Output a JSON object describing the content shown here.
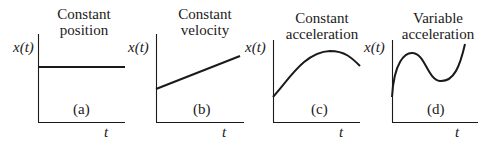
{
  "figure": {
    "ylabel": "x(t)",
    "xlabel": "t",
    "panels": [
      {
        "id": "a",
        "label": "(a)",
        "title_line1": "Constant",
        "title_line2": "position",
        "curve": "horizontal line"
      },
      {
        "id": "b",
        "label": "(b)",
        "title_line1": "Constant",
        "title_line2": "velocity",
        "curve": "rising straight line"
      },
      {
        "id": "c",
        "label": "(c)",
        "title_line1": "Constant",
        "title_line2": "acceleration",
        "curve": "downward parabola"
      },
      {
        "id": "d",
        "label": "(d)",
        "title_line1": "Variable",
        "title_line2": "acceleration",
        "curve": "cubic-like curve"
      }
    ]
  },
  "colors": {
    "line": "#1a1a1a",
    "background": "#ffffff"
  }
}
